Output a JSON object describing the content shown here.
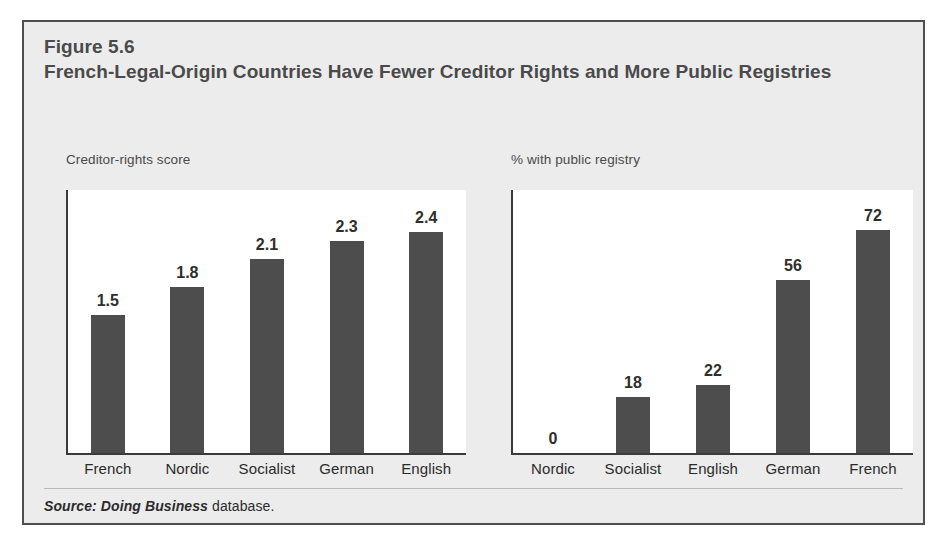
{
  "figure": {
    "number": "Figure 5.6",
    "title": "French-Legal-Origin Countries Have Fewer Creditor Rights and More Public Registries",
    "source_italic": "Source: Doing Business",
    "source_roman": " database."
  },
  "colors": {
    "frame_background": "#ececec",
    "frame_border": "#4f4f4f",
    "plot_background": "#ffffff",
    "bar_fill": "#4d4d4d",
    "axis_line": "#3a3a3a",
    "title_text": "#4a4a4a",
    "label_text": "#2b2b2b"
  },
  "chart_data": [
    {
      "type": "bar",
      "title": "Creditor-rights score",
      "panel": "left",
      "categories": [
        "French",
        "Nordic",
        "Socialist",
        "German",
        "English"
      ],
      "values": [
        1.5,
        1.8,
        2.1,
        2.3,
        2.4
      ],
      "value_labels": [
        "1.5",
        "1.8",
        "2.1",
        "2.3",
        "2.4"
      ],
      "xlabel": "",
      "ylabel": "Creditor-rights score",
      "ylim": [
        0,
        2.85
      ],
      "grid": false,
      "legend": "none"
    },
    {
      "type": "bar",
      "title": "% with public registry",
      "panel": "right",
      "categories": [
        "Nordic",
        "Socialist",
        "English",
        "German",
        "French"
      ],
      "values": [
        0,
        18,
        22,
        56,
        72
      ],
      "value_labels": [
        "0",
        "18",
        "22",
        "56",
        "72"
      ],
      "xlabel": "",
      "ylabel": "% with public registry",
      "ylim": [
        0,
        85
      ],
      "grid": false,
      "legend": "none"
    }
  ]
}
